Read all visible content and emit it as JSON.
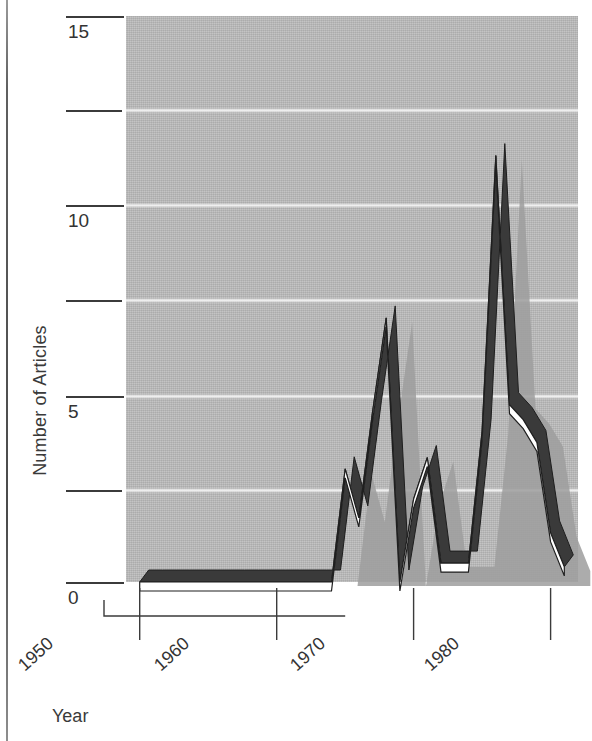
{
  "figure": {
    "axis_labels": {
      "y": "Number of Articles",
      "x": "Year"
    }
  },
  "chart_data": {
    "type": "line",
    "style": "3d-ribbon-line",
    "title": "",
    "xlabel": "Year",
    "ylabel": "Number of Articles",
    "xlim": [
      1949,
      1982
    ],
    "ylim": [
      0,
      15
    ],
    "grid": true,
    "legend": "none",
    "xticks": [
      1950,
      1960,
      1970,
      1980
    ],
    "xtick_labels": [
      "1950",
      "1960",
      "1970",
      "1980"
    ],
    "yticks": [
      0,
      2.5,
      5,
      7.5,
      10,
      12.5,
      15
    ],
    "ytick_labels": [
      "0",
      "",
      "5",
      "",
      "10",
      "",
      "15"
    ],
    "x": [
      1950,
      1951,
      1952,
      1953,
      1954,
      1955,
      1956,
      1957,
      1958,
      1959,
      1960,
      1961,
      1962,
      1963,
      1964,
      1965,
      1966,
      1967,
      1968,
      1969,
      1970,
      1971,
      1972,
      1973,
      1974,
      1975,
      1976,
      1977,
      1978,
      1979,
      1980,
      1981
    ],
    "values": [
      0,
      0,
      0,
      0,
      0,
      0,
      0,
      0,
      0,
      0,
      0,
      0,
      0,
      0,
      0,
      3,
      1.7,
      4.5,
      7,
      0,
      2.2,
      3.3,
      0.5,
      0.5,
      0.5,
      4,
      11.3,
      4.7,
      4.3,
      3.7,
      1.3,
      0.4
    ],
    "colors": {
      "panel": "#b9b9b9",
      "gridline": "#f4f4f4",
      "ribbon_top": "#ffffff",
      "ribbon_side": "#3a3a3a",
      "shadow": "#9a9a9a",
      "axis": "#3b3b3b",
      "text": "#333333"
    }
  },
  "ytick_render": [
    {
      "label": "15",
      "y": 16,
      "major": true
    },
    {
      "label": "",
      "y": 110,
      "major": false
    },
    {
      "label": "10",
      "y": 205,
      "major": true
    },
    {
      "label": "",
      "y": 300,
      "major": false
    },
    {
      "label": "5",
      "y": 396,
      "major": true
    },
    {
      "label": "",
      "y": 490,
      "major": false
    },
    {
      "label": "0",
      "y": 582,
      "major": true
    }
  ],
  "gridlines_y": [
    110,
    205,
    300,
    396,
    490
  ],
  "xtick_render": [
    {
      "label": "1950",
      "x": 126,
      "lx": 14,
      "ly": 640
    },
    {
      "label": "1960",
      "x": 258,
      "lx": 148,
      "ly": 640
    },
    {
      "label": "1970",
      "x": 392,
      "lx": 282,
      "ly": 640
    },
    {
      "label": "1980",
      "x": 524,
      "lx": 414,
      "ly": 640
    }
  ]
}
